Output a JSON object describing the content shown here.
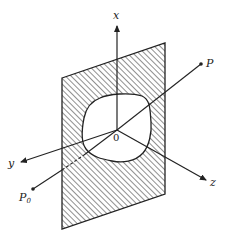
{
  "figure": {
    "type": "3d-coordinate-diagram",
    "colors": {
      "ink": "#222222",
      "background": "#ffffff"
    },
    "labels": {
      "x_axis": "x",
      "y_axis": "y",
      "z_axis": "z",
      "origin": "0",
      "point_p": "P",
      "point_p0": "P",
      "point_p0_sub": "0"
    }
  }
}
